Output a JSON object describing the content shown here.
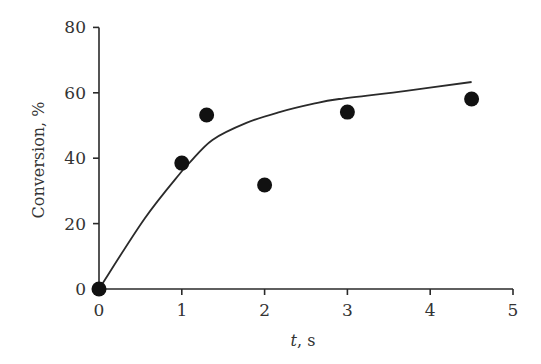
{
  "chart_data": {
    "type": "scatter",
    "title": "",
    "xlabel": "t, s",
    "xlabel_italic_part": "t",
    "xlabel_rest": ", s",
    "ylabel": "Conversion, %",
    "xlim": [
      0,
      5
    ],
    "ylim": [
      0,
      80
    ],
    "xticks": [
      0,
      1,
      2,
      3,
      4,
      5
    ],
    "yticks": [
      0,
      20,
      40,
      60,
      80
    ],
    "grid": false,
    "legend": null,
    "series": [
      {
        "name": "experimental",
        "kind": "scatter",
        "marker": "filled-circle",
        "x": [
          0,
          1.0,
          1.3,
          2.0,
          3.0,
          4.5
        ],
        "y": [
          0,
          38.5,
          53.2,
          31.8,
          54.1,
          58.1
        ]
      },
      {
        "name": "model fit",
        "kind": "line",
        "x": [
          0,
          0.55,
          1.0,
          1.1,
          1.37,
          1.78,
          2.18,
          2.58,
          2.9,
          3.71,
          4.5
        ],
        "y": [
          0,
          21.5,
          36.0,
          38.8,
          45.6,
          50.8,
          54.1,
          56.6,
          58.1,
          60.6,
          63.3
        ]
      }
    ]
  },
  "colors": {
    "axis": "#2a2a2a",
    "marker": "#111111",
    "text": "#333333",
    "background": "#ffffff"
  },
  "layout": {
    "x0_px": 99,
    "x_px_per_unit": 82.8,
    "y0_px": 289,
    "y_px_per_unit": 3.27
  }
}
